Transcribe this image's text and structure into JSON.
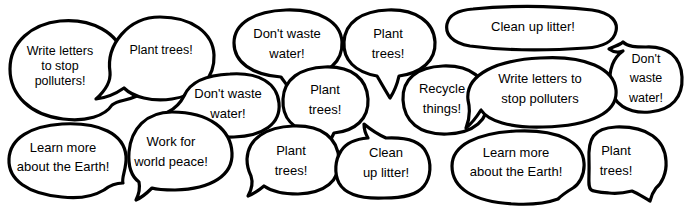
{
  "figure": {
    "background_color": "#ffffff",
    "outline_color": "#000000",
    "text_color": "#000000",
    "width": 689,
    "height": 214
  },
  "bubbles": [
    {
      "id": "bubble-write-letters-1",
      "text": "Write letters\nto stop\npolluters!",
      "x": 60,
      "y": 66,
      "font_size": 12.5,
      "tail": "bottom-right"
    },
    {
      "id": "bubble-plant-trees-1",
      "text": "Plant trees!",
      "x": 161,
      "y": 50,
      "font_size": 12.5,
      "tail": "bottom-left"
    },
    {
      "id": "bubble-dont-waste-water-1",
      "text": "Don't waste\nwater!",
      "x": 287,
      "y": 44,
      "font_size": 13,
      "tail": "bottom"
    },
    {
      "id": "bubble-plant-trees-2",
      "text": "Plant\ntrees!",
      "x": 388,
      "y": 44,
      "font_size": 13,
      "tail": "bottom"
    },
    {
      "id": "bubble-clean-up-litter-1",
      "text": "Clean up litter!",
      "x": 533,
      "y": 27,
      "font_size": 13,
      "tail": "none"
    },
    {
      "id": "bubble-dont-waste-water-2",
      "text": "Don't waste\nwater!",
      "x": 646,
      "y": 79,
      "font_size": 12.5,
      "tail": "left"
    },
    {
      "id": "bubble-dont-waste-water-3",
      "text": "Don't waste\nwater!",
      "x": 228,
      "y": 104,
      "font_size": 13,
      "tail": "left"
    },
    {
      "id": "bubble-plant-trees-3",
      "text": "Plant\ntrees!",
      "x": 325,
      "y": 100,
      "font_size": 13,
      "tail": "bottom"
    },
    {
      "id": "bubble-recycle-things-1",
      "text": "Recycle\nthings!",
      "x": 442,
      "y": 99,
      "font_size": 13,
      "tail": "none"
    },
    {
      "id": "bubble-write-letters-2",
      "text": "Write letters to\nstop polluters",
      "x": 540,
      "y": 89,
      "font_size": 13,
      "tail": "bottom-left"
    },
    {
      "id": "bubble-learn-more-1",
      "text": "Learn more\nabout the Earth!",
      "x": 63,
      "y": 158,
      "font_size": 13,
      "tail": "bottom-right"
    },
    {
      "id": "bubble-work-for-peace-1",
      "text": "Work for\nworld peace!",
      "x": 171,
      "y": 152,
      "font_size": 13,
      "tail": "bottom-left"
    },
    {
      "id": "bubble-plant-trees-4",
      "text": "Plant\ntrees!",
      "x": 291,
      "y": 161,
      "font_size": 13,
      "tail": "bottom-left"
    },
    {
      "id": "bubble-clean-up-litter-2",
      "text": "Clean\nup litter!",
      "x": 386,
      "y": 163,
      "font_size": 13,
      "tail": "top"
    },
    {
      "id": "bubble-learn-more-2",
      "text": "Learn more\nabout the Earth!",
      "x": 516,
      "y": 163,
      "font_size": 13,
      "tail": "bottom-right"
    },
    {
      "id": "bubble-plant-trees-5",
      "text": "Plant\ntrees!",
      "x": 616,
      "y": 161,
      "font_size": 13,
      "tail": "bottom-right"
    }
  ]
}
